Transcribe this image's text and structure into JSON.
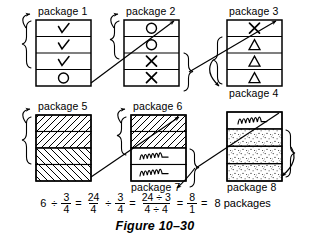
{
  "figure": {
    "caption": "Figure 10–30",
    "packages": [
      {
        "id": "package-1",
        "label": "package 1",
        "cells": [
          "check",
          "check",
          "check",
          "circle"
        ]
      },
      {
        "id": "package-2",
        "label": "package 2",
        "cells": [
          "circle",
          "circle",
          "cross",
          "cross"
        ]
      },
      {
        "id": "package-3",
        "label": "package 3",
        "cells": [
          "cross",
          "triangle",
          "triangle",
          "triangle"
        ]
      },
      {
        "id": "package-4",
        "label": "package 4",
        "cells": []
      },
      {
        "id": "package-5",
        "label": "package 5",
        "cells": [
          "hatch-left",
          "hatch-left",
          "hatch-right",
          "hatch-right"
        ]
      },
      {
        "id": "package-6",
        "label": "package 6",
        "cells": [
          "hatch-left",
          "hatch-left",
          "squiggle",
          "squiggle"
        ]
      },
      {
        "id": "package-7",
        "label": "package 7",
        "cells": []
      },
      {
        "id": "package-8",
        "label": "package 8",
        "cells": [
          "squiggle",
          "stipple",
          "stipple",
          "stipple"
        ]
      }
    ],
    "equation": {
      "terms": [
        {
          "kind": "int",
          "value": "6"
        },
        {
          "kind": "op",
          "value": "÷"
        },
        {
          "kind": "frac",
          "num": "3",
          "den": "4"
        },
        {
          "kind": "op",
          "value": "="
        },
        {
          "kind": "frac",
          "num": "24",
          "den": "4"
        },
        {
          "kind": "op",
          "value": "÷"
        },
        {
          "kind": "frac",
          "num": "3",
          "den": "4"
        },
        {
          "kind": "op",
          "value": "="
        },
        {
          "kind": "frac",
          "num": "24 ÷ 3",
          "den": "4 ÷ 4"
        },
        {
          "kind": "op",
          "value": "="
        },
        {
          "kind": "frac",
          "num": "8",
          "den": "1"
        },
        {
          "kind": "op",
          "value": "="
        },
        {
          "kind": "text",
          "value": "8 packages"
        }
      ]
    },
    "colors": {
      "ink": "#000000",
      "paper": "#ffffff",
      "cell_fill": "#ffffff"
    }
  }
}
